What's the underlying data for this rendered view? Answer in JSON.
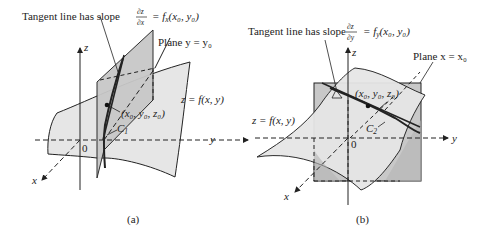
{
  "figure": {
    "panel_a": {
      "caption": "(a)",
      "tangent_label_prefix": "Tangent line has slope",
      "tangent_frac_num": "∂z",
      "tangent_frac_den": "∂x",
      "tangent_rhs": "= f",
      "tangent_rhs_sub": "x",
      "tangent_rhs_args": "(x₀, y₀)",
      "plane_label": "Plane y = y₀",
      "point_label": "(x₀, y₀, z₀)",
      "surface_label": "z = f(x, y)",
      "curve_label": "C",
      "curve_sub": "1",
      "axis_z": "z",
      "axis_y": "y",
      "axis_x": "x",
      "origin": "0"
    },
    "panel_b": {
      "caption": "(b)",
      "tangent_label_prefix": "Tangent line has slope",
      "tangent_frac_num": "∂z",
      "tangent_frac_den": "∂y",
      "tangent_rhs": "= f",
      "tangent_rhs_sub": "y",
      "tangent_rhs_args": "(x₀, y₀)",
      "plane_label": "Plane x = x₀",
      "point_label": "(x₀, y₀, z₀)",
      "surface_label": "z = f(x, y)",
      "curve_label": "C",
      "curve_sub": "2",
      "axis_z": "z",
      "axis_y": "y",
      "axis_x": "x",
      "origin": "0"
    },
    "colors": {
      "surface_fill": "#e6e6e6",
      "plane_fill": "#c8c8c8",
      "plane_dark": "#b4b4b4",
      "stroke": "#222222"
    }
  }
}
